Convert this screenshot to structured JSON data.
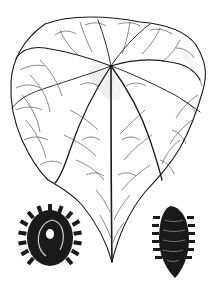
{
  "figure": {
    "subject": "botanical illustration",
    "elements": [
      {
        "name": "leaf",
        "description": "heart-shaped leaf with palmate venation"
      },
      {
        "name": "seed-face",
        "description": "dark ridged seed, face view"
      },
      {
        "name": "seed-side",
        "description": "dark ridged seed, side view"
      }
    ]
  },
  "colors": {
    "ink": "#1a1a1a",
    "background": "#ffffff",
    "shade": "#9a9a9a"
  }
}
